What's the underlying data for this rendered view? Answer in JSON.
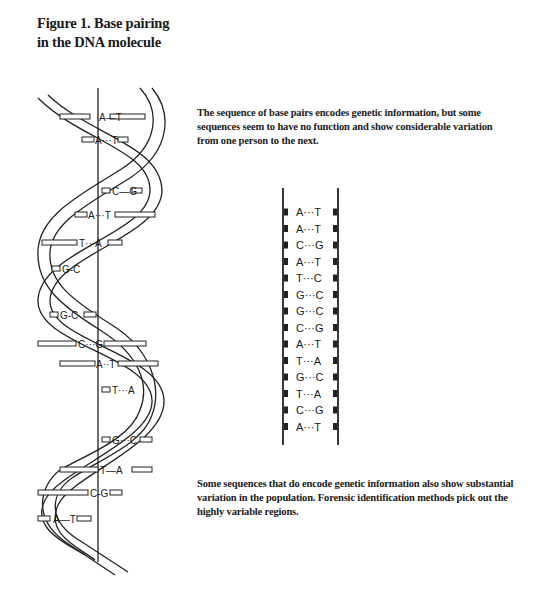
{
  "figure": {
    "title_line1": "Figure 1.  Base pairing",
    "title_line2": "in the DNA molecule"
  },
  "captions": {
    "top": "The sequence of base pairs encodes genetic information, but some sequences seem to have no function and show considerable variation from one person to the next.",
    "bottom": "Some sequences that do encode genetic information also show substantial variation in the population.  Forensic identification methods pick out the highly variable regions."
  },
  "helix": {
    "pairs": [
      {
        "label": "A—T",
        "y": 117
      },
      {
        "label": "A···T",
        "y": 140
      },
      {
        "label": "C—G",
        "y": 191
      },
      {
        "label": "A···T",
        "y": 215
      },
      {
        "label": "T···A",
        "y": 243
      },
      {
        "label": "G-C",
        "y": 269
      },
      {
        "label": "G-C",
        "y": 315
      },
      {
        "label": "C···G",
        "y": 344
      },
      {
        "label": "A··T",
        "y": 364
      },
      {
        "label": "T···A",
        "y": 390
      },
      {
        "label": "G···C",
        "y": 440
      },
      {
        "label": "T—A",
        "y": 470
      },
      {
        "label": "C-G",
        "y": 493
      },
      {
        "label": "A—T",
        "y": 519
      }
    ]
  },
  "ladder": {
    "pairs": [
      {
        "left": "A",
        "right": "T"
      },
      {
        "left": "A",
        "right": "T"
      },
      {
        "left": "C",
        "right": "G"
      },
      {
        "left": "A",
        "right": "T"
      },
      {
        "left": "T",
        "right": "C"
      },
      {
        "left": "G",
        "right": "C"
      },
      {
        "left": "G",
        "right": "C"
      },
      {
        "left": "C",
        "right": "G"
      },
      {
        "left": "A",
        "right": "T"
      },
      {
        "left": "T",
        "right": "A"
      },
      {
        "left": "G",
        "right": "C"
      },
      {
        "left": "T",
        "right": "A"
      },
      {
        "left": "C",
        "right": "G"
      },
      {
        "left": "A",
        "right": "T"
      }
    ],
    "bond": "···"
  }
}
